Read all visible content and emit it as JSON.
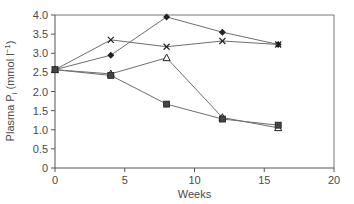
{
  "chart_data": {
    "type": "line",
    "title": "",
    "xlabel": "Weeks",
    "ylabel": "Plasma P",
    "ylabel_subscript": "i",
    "ylabel_units": " (mmol l",
    "ylabel_units_sup": "−1",
    "ylabel_units_close": ")",
    "xlim": [
      0,
      20
    ],
    "ylim": [
      0,
      4.0
    ],
    "xticks": [
      0,
      5,
      10,
      15,
      20
    ],
    "xtick_labels": [
      "0",
      "5",
      "10",
      "15",
      "20"
    ],
    "yticks": [
      0,
      0.5,
      1.0,
      1.5,
      2.0,
      2.5,
      3.0,
      3.5,
      4.0
    ],
    "ytick_labels": [
      "0",
      "0.5",
      "1.0",
      "1.5",
      "2.0",
      "2.5",
      "3.0",
      "3.5",
      "4.0"
    ],
    "grid": false,
    "legend": "none",
    "x": [
      0,
      4,
      8,
      12,
      16
    ],
    "series": [
      {
        "name": "diamond",
        "marker": "diamond",
        "values": [
          2.57,
          2.95,
          3.95,
          3.55,
          3.23
        ]
      },
      {
        "name": "cross",
        "marker": "x",
        "values": [
          2.57,
          3.35,
          3.17,
          3.32,
          3.23
        ]
      },
      {
        "name": "triangle",
        "marker": "triangle-open",
        "values": [
          2.57,
          2.46,
          2.88,
          1.32,
          1.05
        ]
      },
      {
        "name": "square",
        "marker": "square",
        "values": [
          2.57,
          2.42,
          1.67,
          1.28,
          1.12
        ]
      }
    ],
    "colors": {
      "line": "#6e6e6e",
      "marker": "#222222",
      "axis": "#555555",
      "frame": "#777777"
    }
  }
}
